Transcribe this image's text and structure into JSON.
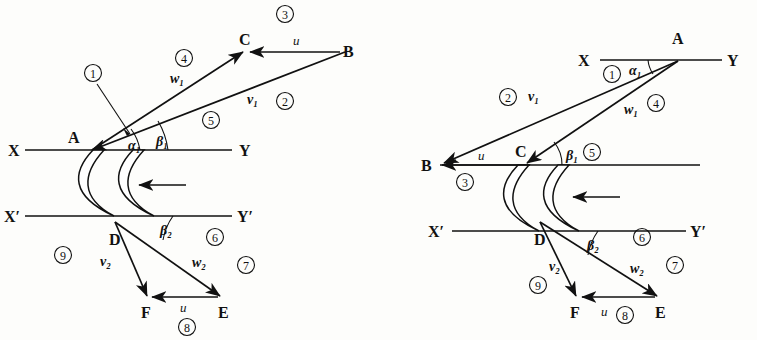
{
  "figure": {
    "type": "technical-diagram"
  },
  "common": {
    "labels": {
      "A": "A",
      "B": "B",
      "C": "C",
      "D": "D",
      "E": "E",
      "F": "F",
      "X": "X",
      "Y": "Y",
      "Xp": "X′",
      "Yp": "Y′"
    },
    "velocities": {
      "u": "u",
      "v1": "v₁",
      "w1": "w₁",
      "v2": "v₂",
      "w2": "w₂"
    },
    "angles": {
      "alpha1": "α₁",
      "beta1": "β₁",
      "beta2": "β₂"
    },
    "callouts": {
      "n1": "①",
      "n2": "②",
      "n3": "③",
      "n4": "④",
      "n5": "⑤",
      "n6": "⑥",
      "n7": "⑦",
      "n8": "⑧",
      "n9": "⑨"
    }
  },
  "left_diagram": {
    "name": "left-velocity-diagram",
    "description": "Inlet velocity triangle A-B-C above blade row, outlet triangle D-E-F below; absolute velocity v1 drawn from B to A, blade speed u from B to C, relative velocity w1 from A to C.",
    "points": {
      "A": {
        "x": 75,
        "y": 141
      },
      "B": {
        "x": 345,
        "y": 52
      },
      "C": {
        "x": 245,
        "y": 51
      },
      "D": {
        "x": 115,
        "y": 232
      },
      "E": {
        "x": 223,
        "y": 303
      },
      "F": {
        "x": 148,
        "y": 303
      }
    },
    "axis_labels": {
      "X": "X",
      "Y": "Y",
      "Xp": "X′",
      "Yp": "Y′"
    },
    "callout_positions": {
      "n1": {
        "x": 93,
        "y": 73
      },
      "n2": {
        "x": 285,
        "y": 101
      },
      "n3": {
        "x": 285,
        "y": 14
      },
      "n4": {
        "x": 184,
        "y": 58
      },
      "n5": {
        "x": 211,
        "y": 120
      },
      "n6": {
        "x": 215,
        "y": 237
      },
      "n7": {
        "x": 246,
        "y": 265
      },
      "n8": {
        "x": 187,
        "y": 327
      },
      "n9": {
        "x": 63,
        "y": 255
      }
    }
  },
  "right_diagram": {
    "name": "right-velocity-diagram",
    "description": "Mirror arrangement: A at upper right on line X-Y, B at left on blade inlet line, C near blade leading edge; outlet triangle D-E-F below line X'-Y'.",
    "points": {
      "A": {
        "x": 678,
        "y": 60
      },
      "B": {
        "x": 437,
        "y": 165
      },
      "C": {
        "x": 523,
        "y": 160
      },
      "D": {
        "x": 540,
        "y": 232
      },
      "E": {
        "x": 660,
        "y": 303
      },
      "F": {
        "x": 578,
        "y": 303
      }
    },
    "axis_labels": {
      "X": "X",
      "Y": "Y",
      "Xp": "X′",
      "Yp": "Y′"
    },
    "callout_positions": {
      "n1": {
        "x": 612,
        "y": 74
      },
      "n2": {
        "x": 510,
        "y": 97
      },
      "n3": {
        "x": 465,
        "y": 182
      },
      "n4": {
        "x": 655,
        "y": 103
      },
      "n5": {
        "x": 613,
        "y": 146
      },
      "n6": {
        "x": 642,
        "y": 237
      },
      "n7": {
        "x": 675,
        "y": 265
      },
      "n8": {
        "x": 625,
        "y": 315
      },
      "n9": {
        "x": 538,
        "y": 285
      }
    }
  },
  "flow_arrow": {
    "label": "flow direction",
    "direction": "left"
  }
}
